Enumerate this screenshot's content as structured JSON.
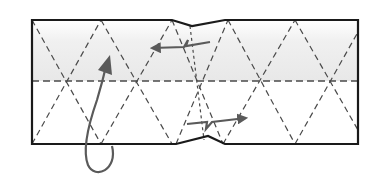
{
  "diagram": {
    "colors": {
      "outline": "#1a1a1a",
      "crease": "#4a4a4a",
      "arrow": "#5a5a5a",
      "shade_top": "#ececec",
      "background": "#ffffff"
    },
    "elements": {
      "paper_outline": "paper strip outline with central pleat notch",
      "horizontal_crease": "horizontal valley fold midline",
      "diagonal_creases": "diagonal dashed creases forming triangle grid",
      "curved_arrow": "turn-over / tuck-under arrow",
      "pleat_arrow_top": "pleat arrow pointing left",
      "pleat_arrow_bottom": "pleat arrow pointing right"
    }
  }
}
